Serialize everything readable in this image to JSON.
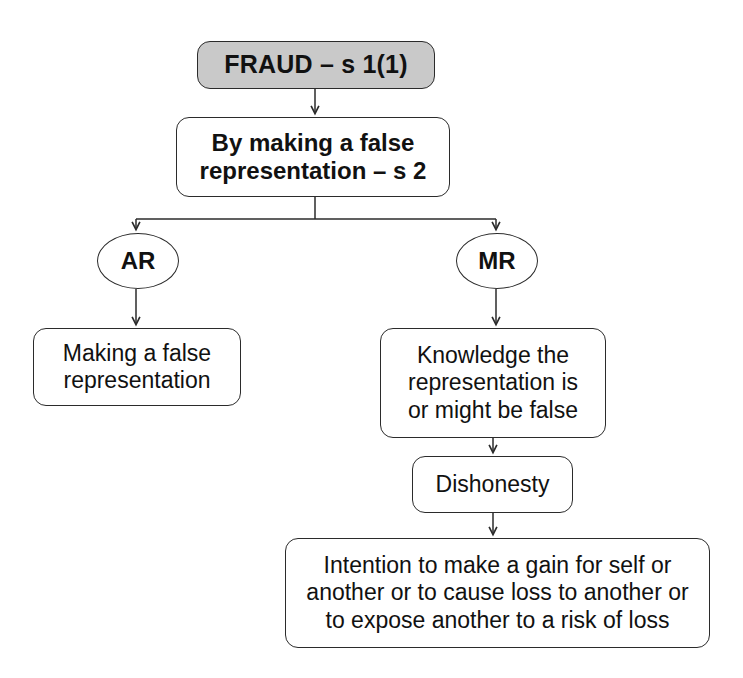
{
  "diagram": {
    "background_color": "#ffffff",
    "line_color": "#2b2b2b",
    "shaded_fill": "#c9c9c9",
    "node_fill": "#ffffff",
    "nodes": {
      "fraud": {
        "label": "FRAUD – s 1(1)",
        "shape": "rounded-rect",
        "fill": "#c9c9c9",
        "weight": "bold"
      },
      "false_representation": {
        "label": "By making a false\nrepresentation – s 2",
        "shape": "rounded-rect",
        "fill": "#ffffff",
        "weight": "bold"
      },
      "ar": {
        "label": "AR",
        "shape": "ellipse",
        "fill": "#ffffff",
        "weight": "bold"
      },
      "mr": {
        "label": "MR",
        "shape": "ellipse",
        "fill": "#ffffff",
        "weight": "bold"
      },
      "making_false_representation": {
        "label": "Making a false\nrepresentation",
        "shape": "rounded-rect",
        "fill": "#ffffff",
        "weight": "normal"
      },
      "knowledge": {
        "label": "Knowledge the\nrepresentation is\nor might be false",
        "shape": "rounded-rect",
        "fill": "#ffffff",
        "weight": "normal"
      },
      "dishonesty": {
        "label": "Dishonesty",
        "shape": "rounded-rect",
        "fill": "#ffffff",
        "weight": "normal"
      },
      "intention": {
        "label": "Intention to make a gain for self or\nanother or to cause loss to another or\nto expose another to a risk of loss",
        "shape": "rounded-rect",
        "fill": "#ffffff",
        "weight": "normal"
      }
    },
    "edges": [
      {
        "from": "fraud",
        "to": "false_representation",
        "style": "arrow"
      },
      {
        "from": "false_representation",
        "to": "ar",
        "style": "elbow-arrow"
      },
      {
        "from": "false_representation",
        "to": "mr",
        "style": "elbow-arrow"
      },
      {
        "from": "ar",
        "to": "making_false_representation",
        "style": "arrow"
      },
      {
        "from": "mr",
        "to": "knowledge",
        "style": "arrow"
      },
      {
        "from": "knowledge",
        "to": "dishonesty",
        "style": "arrow"
      },
      {
        "from": "dishonesty",
        "to": "intention",
        "style": "arrow"
      }
    ]
  }
}
